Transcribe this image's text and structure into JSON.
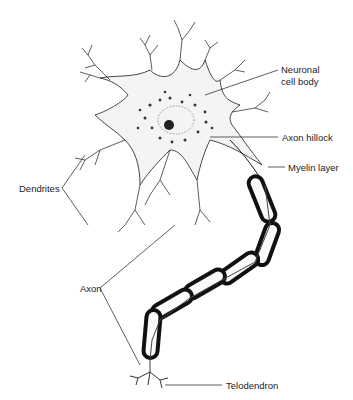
{
  "diagram": {
    "labels": {
      "neuronal_cell_body_line1": "Neuronal",
      "neuronal_cell_body_line2": "cell body",
      "dendrites": "Dendrites",
      "axon_hillock": "Axon hillock",
      "myelin_layer": "Myelin layer",
      "axon": "Axon",
      "telodendron": "Telodendron"
    },
    "colors": {
      "ink": "#1a1a1a",
      "background": "#ffffff"
    }
  }
}
